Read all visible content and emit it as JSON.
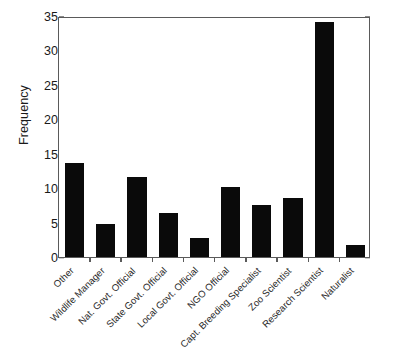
{
  "chart_data": {
    "type": "bar",
    "title": "",
    "xlabel": "",
    "ylabel": "Frequency",
    "categories": [
      "Other",
      "Wildlife Manager",
      "Nat. Govt. Official",
      "State Govt. Official",
      "Local Govt. Official",
      "NGO Official",
      "Capt. Breeding Specialist",
      "Zoo Scientist",
      "Research Scientist",
      "Naturalist"
    ],
    "values": [
      13.6,
      4.8,
      11.6,
      6.4,
      2.8,
      10.1,
      7.6,
      8.6,
      34.2,
      1.8
    ],
    "ylim": [
      0,
      35
    ],
    "yticks": [
      0,
      5,
      10,
      15,
      20,
      25,
      30,
      35
    ],
    "ytick_labels": [
      "0",
      "5",
      "10",
      "15",
      "20",
      "25",
      "30",
      "35"
    ],
    "y_minor_ticks": [
      2.5,
      7.5,
      12.5,
      17.5,
      22.5,
      27.5,
      32.5
    ],
    "grid": false,
    "legend": null,
    "bar_color": "#0a0a0a",
    "axis_color": "#5a5a5a",
    "background": "#ffffff",
    "xlabel_rotation": -45
  }
}
